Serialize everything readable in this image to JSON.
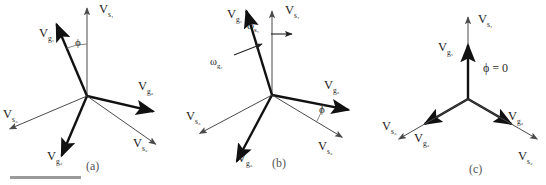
{
  "figure": {
    "type": "phasor-vector-diagram",
    "background_color": "#ffffff",
    "stroke_colors": {
      "grid_vector": "#111111",
      "source_vector": "#4a4a4a",
      "angle_arc": "#777777",
      "omega_arrow": "#222222",
      "scale_bar": "#9a9a9a"
    },
    "width": 546,
    "height": 185
  },
  "panels": [
    {
      "id": "a",
      "caption": "(a)",
      "origin": {
        "x": 87,
        "y": 96
      },
      "angle_label": "ϕ",
      "vectors": [
        {
          "name": "V",
          "sub": "s₁",
          "label_x": 99,
          "label_y": 3,
          "angle_deg": 90,
          "length": 88,
          "style": "source"
        },
        {
          "name": "V",
          "sub": "g₁",
          "label_x": 39,
          "label_y": 27,
          "angle_deg": 113,
          "length": 78,
          "style": "grid"
        },
        {
          "name": "V",
          "sub": "g₂",
          "label_x": 138,
          "label_y": 80,
          "angle_deg": -13,
          "length": 68,
          "style": "grid"
        },
        {
          "name": "V",
          "sub": "s₂",
          "label_x": 133,
          "label_y": 137,
          "angle_deg": -35,
          "length": 84,
          "style": "source"
        },
        {
          "name": "V",
          "sub": "g₃",
          "label_x": 47,
          "label_y": 150,
          "angle_deg": -113,
          "length": 65,
          "style": "grid"
        },
        {
          "name": "V",
          "sub": "s₃",
          "label_x": 3,
          "label_y": 108,
          "angle_deg": -157,
          "length": 84,
          "style": "source"
        }
      ]
    },
    {
      "id": "b",
      "caption": "(b)",
      "origin": {
        "x": 272,
        "y": 95
      },
      "angle_label": "ϕ",
      "omega_labels": [
        {
          "name": "ω",
          "sub": "s₁",
          "label_x": 247,
          "label_y": 21
        },
        {
          "name": "ω",
          "sub": "g₁",
          "label_x": 210,
          "label_y": 57
        }
      ],
      "vectors": [
        {
          "name": "V",
          "sub": "s₁",
          "label_x": 285,
          "label_y": 4,
          "angle_deg": 90,
          "length": 84,
          "style": "source"
        },
        {
          "name": "V",
          "sub": "g₁",
          "label_x": 227,
          "label_y": 8,
          "angle_deg": 107,
          "length": 88,
          "style": "grid"
        },
        {
          "name": "V",
          "sub": "g₂",
          "label_x": 324,
          "label_y": 79,
          "angle_deg": -11,
          "length": 78,
          "style": "grid"
        },
        {
          "name": "V",
          "sub": "s₂",
          "label_x": 318,
          "label_y": 140,
          "angle_deg": -31,
          "length": 82,
          "style": "source"
        },
        {
          "name": "V",
          "sub": "g₃",
          "label_x": 237,
          "label_y": 152,
          "angle_deg": -118,
          "length": 75,
          "style": "grid"
        },
        {
          "name": "V",
          "sub": "s₃",
          "label_x": 186,
          "label_y": 110,
          "angle_deg": -152,
          "length": 82,
          "style": "source"
        }
      ]
    },
    {
      "id": "c",
      "caption": "(c)",
      "origin": {
        "x": 468,
        "y": 99
      },
      "angle_label": "ϕ = 0",
      "vectors": [
        {
          "name": "V",
          "sub": "s₁",
          "label_x": 478,
          "label_y": 13,
          "angle_deg": 90,
          "length": 82,
          "style": "source"
        },
        {
          "name": "V",
          "sub": "g₁",
          "label_x": 438,
          "label_y": 41,
          "angle_deg": 90,
          "length": 54,
          "style": "grid"
        },
        {
          "name": "V",
          "sub": "g₂",
          "label_x": 508,
          "label_y": 110,
          "angle_deg": -30,
          "length": 50,
          "style": "grid"
        },
        {
          "name": "V",
          "sub": "s₂",
          "label_x": 518,
          "label_y": 150,
          "angle_deg": -30,
          "length": 80,
          "style": "source"
        },
        {
          "name": "V",
          "sub": "g₃",
          "label_x": 414,
          "label_y": 132,
          "angle_deg": -150,
          "length": 50,
          "style": "grid"
        },
        {
          "name": "V",
          "sub": "s₃",
          "label_x": 382,
          "label_y": 120,
          "angle_deg": -150,
          "length": 80,
          "style": "source"
        }
      ]
    }
  ],
  "captions": [
    {
      "text": "(a)",
      "x": 86,
      "y": 160
    },
    {
      "text": "(b)",
      "x": 272,
      "y": 157
    },
    {
      "text": "(c)",
      "x": 469,
      "y": 163
    }
  ],
  "scale_bar": {
    "x": 10,
    "y": 176,
    "width": 71,
    "height": 3
  }
}
